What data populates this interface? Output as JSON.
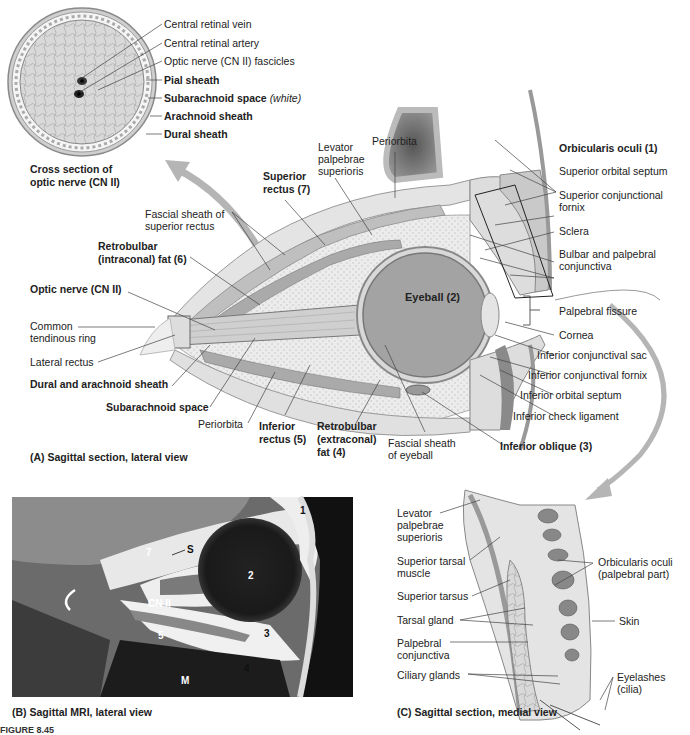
{
  "figure": {
    "title_fragment": "FIGURE 8.45"
  },
  "panel_cross_section": {
    "caption_line1": "Cross section of",
    "caption_line2": "optic nerve (CN II)",
    "labels": [
      {
        "text": "Central retinal vein",
        "bold": false
      },
      {
        "text": "Central retinal artery",
        "bold": false
      },
      {
        "text": "Optic nerve (CN II) fascicles",
        "bold": false
      },
      {
        "text": "Pial sheath",
        "bold": true
      },
      {
        "text": "Subarachnoid space",
        "bold": true,
        "suffix": "(white)"
      },
      {
        "text": "Arachnoid sheath",
        "bold": true
      },
      {
        "text": "Dural sheath",
        "bold": true
      }
    ]
  },
  "panel_a": {
    "caption": "(A) Sagittal section, lateral view",
    "labels": {
      "periorbita_top": "Periorbita",
      "levator_1": "Levator",
      "levator_2": "palpebrae",
      "levator_3": "superioris",
      "superior_rectus_1": "Superior",
      "superior_rectus_2": "rectus (7)",
      "fascial_sheath_sr_1": "Fascial sheath of",
      "fascial_sheath_sr_2": "superior rectus",
      "retrobulbar_intra_1": "Retrobulbar",
      "retrobulbar_intra_2": "(intraconal) fat (6)",
      "optic_nerve": "Optic nerve (CN II)",
      "common_tendinous_1": "Common",
      "common_tendinous_2": "tendinous ring",
      "lateral_rectus": "Lateral rectus",
      "dural_arachnoid": "Dural and arachnoid sheath",
      "subarachnoid": "Subarachnoid space",
      "periorbita_bottom": "Periorbita",
      "inferior_rectus_1": "Inferior",
      "inferior_rectus_2": "rectus (5)",
      "retrobulbar_extra_1": "Retrobulbar",
      "retrobulbar_extra_2": "(extraconal)",
      "retrobulbar_extra_3": "fat (4)",
      "fascial_sheath_eye_1": "Fascial sheath",
      "fascial_sheath_eye_2": "of eyeball",
      "inferior_oblique": "Inferior oblique (3)",
      "eyeball": "Eyeball (2)",
      "orbicularis": "Orbicularis oculi (1)",
      "sup_orbital_septum": "Superior orbital septum",
      "sup_conj_fornix_1": "Superior conjunctional",
      "sup_conj_fornix_2": "fornix",
      "sclera": "Sclera",
      "bulbar_1": "Bulbar and palpebral",
      "bulbar_2": "conjunctiva",
      "palpebral_fissure": "Palpebral fissure",
      "cornea": "Cornea",
      "inf_conj_sac": "Inferior conjunctival sac",
      "inf_conj_fornix": "Inferior conjunctival fornix",
      "inf_orbital_septum": "Inferior orbital septum",
      "inf_check_lig": "Inferior check ligament"
    }
  },
  "panel_b": {
    "caption": "(B) Sagittal MRI, lateral view",
    "markers": [
      "1",
      "2",
      "3",
      "4",
      "5",
      "7",
      "S",
      "CN II",
      "M"
    ]
  },
  "panel_c": {
    "caption": "(C) Sagittal section, medial view",
    "labels": {
      "levator_1": "Levator",
      "levator_2": "palpebrae",
      "levator_3": "superioris",
      "sup_tarsal_1": "Superior tarsal",
      "sup_tarsal_2": "muscle",
      "sup_tarsus": "Superior tarsus",
      "tarsal_gland": "Tarsal gland",
      "palp_conj_1": "Palpebral",
      "palp_conj_2": "conjunctiva",
      "ciliary": "Ciliary glands",
      "orbicularis_1": "Orbicularis oculi",
      "orbicularis_2": "(palpebral part)",
      "skin": "Skin",
      "eyelashes_1": "Eyelashes",
      "eyelashes_2": "(cilia)"
    }
  },
  "colors": {
    "tissue_light": "#e6e6e6",
    "tissue_mid": "#bdbdbd",
    "tissue_dark": "#8a8a8a",
    "arrow": "#b0b0b0",
    "mri_bg": "#6e6e6e"
  }
}
